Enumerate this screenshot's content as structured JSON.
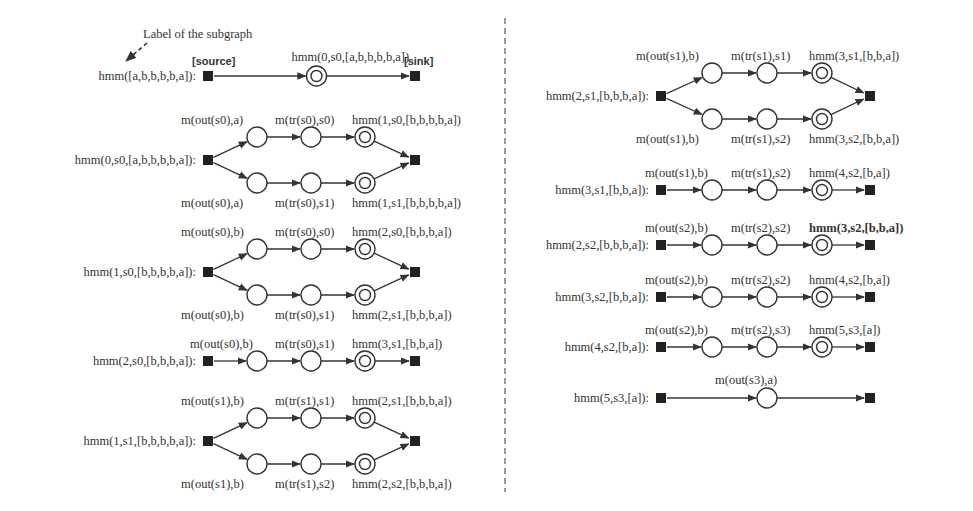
{
  "annotation": {
    "label_of_subgraph": "Label of the subgraph",
    "source_tag": "[source]",
    "sink_tag": "[sink]"
  },
  "colors": {
    "ink": "#333333",
    "square_fill": "#222222",
    "background": "#ffffff"
  },
  "graphs": [
    {
      "id": "g0",
      "panel": "left",
      "y": 76,
      "type": "single-final",
      "label": "hmm([a,b,b,b,b,a]):",
      "final_label": "hmm(0,s0,[a,b,b,b,b,a])"
    },
    {
      "id": "g1",
      "panel": "left",
      "y": 160,
      "type": "branch",
      "label": "hmm(0,s0,[a,b,b,b,b,a]):",
      "top": [
        "m(out(s0),a)",
        "m(tr(s0),s0)",
        "hmm(1,s0,[b,b,b,b,a])"
      ],
      "bottom": [
        "m(out(s0),a)",
        "m(tr(s0),s1)",
        "hmm(1,s1,[b,b,b,b,a])"
      ]
    },
    {
      "id": "g2",
      "panel": "left",
      "y": 272,
      "type": "branch",
      "label": "hmm(1,s0,[b,b,b,b,a]):",
      "top": [
        "m(out(s0),b)",
        "m(tr(s0),s0)",
        "hmm(2,s0,[b,b,b,a])"
      ],
      "bottom": [
        "m(out(s0),b)",
        "m(tr(s0),s1)",
        "hmm(2,s1,[b,b,b,a])"
      ]
    },
    {
      "id": "g3",
      "panel": "left",
      "y": 361,
      "type": "chain",
      "label": "hmm(2,s0,[b,b,b,a]):",
      "top": [
        "m(out(s0),b)",
        "m(tr(s0),s1)",
        "hmm(3,s1,[b,b,a])"
      ]
    },
    {
      "id": "g4",
      "panel": "left",
      "y": 441,
      "type": "branch",
      "label": "hmm(1,s1,[b,b,b,b,a]):",
      "top": [
        "m(out(s1),b)",
        "m(tr(s1),s1)",
        "hmm(2,s1,[b,b,b,a])"
      ],
      "bottom": [
        "m(out(s1),b)",
        "m(tr(s1),s2)",
        "hmm(2,s2,[b,b,b,a])"
      ]
    },
    {
      "id": "g5",
      "panel": "right",
      "y": 96,
      "type": "branch",
      "label": "hmm(2,s1,[b,b,b,a]):",
      "top": [
        "m(out(s1),b)",
        "m(tr(s1),s1)",
        "hmm(3,s1,[b,b,a])"
      ],
      "bottom": [
        "m(out(s1),b)",
        "m(tr(s1),s2)",
        "hmm(3,s2,[b,b,a])"
      ]
    },
    {
      "id": "g6",
      "panel": "right",
      "y": 190,
      "type": "chain",
      "label": "hmm(3,s1,[b,b,a]):",
      "top": [
        "m(out(s1),b)",
        "m(tr(s1),s2)",
        "hmm(4,s2,[b,a])"
      ]
    },
    {
      "id": "g7",
      "panel": "right",
      "y": 245,
      "type": "chain",
      "final_bold": true,
      "label": "hmm(2,s2,[b,b,b,a]):",
      "top": [
        "m(out(s2),b)",
        "m(tr(s2),s2)",
        "hmm(3,s2,[b,b,a])"
      ]
    },
    {
      "id": "g8",
      "panel": "right",
      "y": 297,
      "type": "chain",
      "label": "hmm(3,s2,[b,b,a]):",
      "top": [
        "m(out(s2),b)",
        "m(tr(s2),s2)",
        "hmm(4,s2,[b,a])"
      ]
    },
    {
      "id": "g9",
      "panel": "right",
      "y": 347,
      "type": "chain",
      "label": "hmm(4,s2,[b,a]):",
      "top": [
        "m(out(s2),b)",
        "m(tr(s2),s3)",
        "hmm(5,s3,[a])"
      ]
    },
    {
      "id": "g10",
      "panel": "right",
      "y": 398,
      "type": "single-plain",
      "label": "hmm(5,s3,[a]):",
      "top": [
        "m(out(s3),a)"
      ]
    }
  ]
}
